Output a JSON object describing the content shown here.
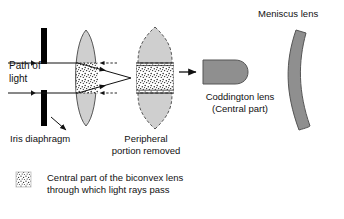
{
  "figure": {
    "background_color": "#ffffff",
    "ink_color": "#111111",
    "lens_fill": "#cfcfcf",
    "lens_dark_fill": "#8f8f8f",
    "stipple_fill": "#ffffff",
    "diaphragm_color": "#000000"
  },
  "labels": {
    "path_of_light": "Path of\nlight",
    "iris_diaphragm": "Iris diaphragm",
    "peripheral_removed": "Peripheral\nportion removed",
    "coddington_lens": "Coddington lens\n(Central part)",
    "meniscus_lens": "Meniscus lens"
  },
  "legend": {
    "swatch": "stipple-swatch",
    "text": "Central part of the biconvex lens\nthrough which light rays pass"
  },
  "elements": [
    {
      "name": "iris-diaphragm",
      "kind": "aperture",
      "label": "Iris diaphragm"
    },
    {
      "name": "biconvex-lens",
      "kind": "lens",
      "label": ""
    },
    {
      "name": "light-rays",
      "kind": "rays",
      "label": "Path of light"
    },
    {
      "name": "truncated-lens",
      "kind": "lens",
      "label": "Peripheral portion removed"
    },
    {
      "name": "coddington-lens",
      "kind": "lens",
      "label": "Coddington lens (Central part)"
    },
    {
      "name": "meniscus-lens",
      "kind": "lens",
      "label": "Meniscus lens"
    }
  ]
}
